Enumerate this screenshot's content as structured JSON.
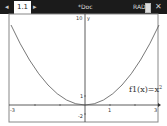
{
  "titlebar": {
    "tab_label": "1.1",
    "doc_title": "*Doc",
    "angle_mode": "RAD",
    "prev_icon": "left-arrow-icon",
    "next_icon": "right-arrow-icon",
    "battery_icon": "battery-icon",
    "close_icon": "close-icon"
  },
  "graph": {
    "function_label": "f1(x)=x",
    "exponent": "2",
    "x_min_label": "-3",
    "x_max_label": "3",
    "x_tick_label": "1",
    "y_max_label": "10",
    "y_axis_label": "y",
    "y_tick_label": "1",
    "y_min_label": "-2",
    "xmin": -3,
    "xmax": 3,
    "ymin": -2,
    "ymax": 10
  }
}
